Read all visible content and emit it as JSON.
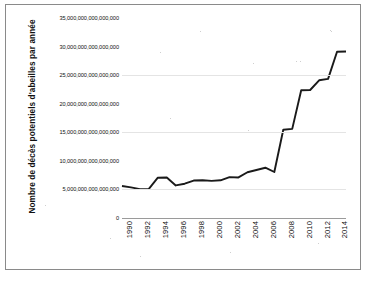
{
  "chart_data": {
    "type": "line",
    "title": "",
    "xlabel": "",
    "ylabel": "Nombre de décès potentiels d'abeilles par année",
    "x": [
      1990,
      1991,
      1992,
      1993,
      1994,
      1995,
      1996,
      1997,
      1998,
      1999,
      2000,
      2001,
      2002,
      2003,
      2004,
      2005,
      2006,
      2007,
      2008,
      2009,
      2010,
      2011,
      2012,
      2013,
      2014,
      2015
    ],
    "values": [
      5600000000000000,
      5350000000000000,
      5050000000000000,
      5100000000000000,
      7050000000000000,
      7100000000000000,
      5700000000000000,
      6000000000000000,
      6550000000000000,
      6600000000000000,
      6500000000000000,
      6600000000000000,
      7150000000000000,
      7100000000000000,
      8000000000000000,
      8400000000000000,
      8800000000000000,
      8050000000000000,
      15450000000000000,
      15600000000000000,
      22350000000000000,
      22400000000000000,
      24100000000000000,
      24350000000000000,
      29100000000000000,
      29150000000000000
    ],
    "xlim": [
      1990,
      2015
    ],
    "ylim": [
      0,
      35000000000000000
    ],
    "ytick_values": [
      0,
      5000000000000000,
      10000000000000000,
      15000000000000000,
      20000000000000000,
      25000000000000000,
      30000000000000000,
      35000000000000000
    ],
    "ytick_labels": [
      "0",
      "5,000,000,000,000,000",
      "10,000,000,000,000,000",
      "15,000,000,000,000,000",
      "20,000,000,000,000,000",
      "25,000,000,000,000,000",
      "30,000,000,000,000,000",
      "35,000,000,000,000,000"
    ],
    "xtick_labels": [
      "1990",
      "1992",
      "1994",
      "1996",
      "1998",
      "2000",
      "2002",
      "2004",
      "2006",
      "2008",
      "2010",
      "2012",
      "2014"
    ],
    "xtick_values": [
      1990,
      1992,
      1994,
      1996,
      1998,
      2000,
      2002,
      2004,
      2006,
      2008,
      2010,
      2012,
      2014
    ],
    "grid": true,
    "grid_axis": "y",
    "gridline_values": [
      5000000000000000,
      15000000000000000,
      25000000000000000
    ],
    "legend": false,
    "legend_position": "none",
    "series_color": "#1a1a1a",
    "gridline_color": "#e4e4e4",
    "axis_color": "#9a9a9a",
    "background_color": "#ffffff",
    "frame_color": "#8a8a8a",
    "line_width": 1.9
  }
}
